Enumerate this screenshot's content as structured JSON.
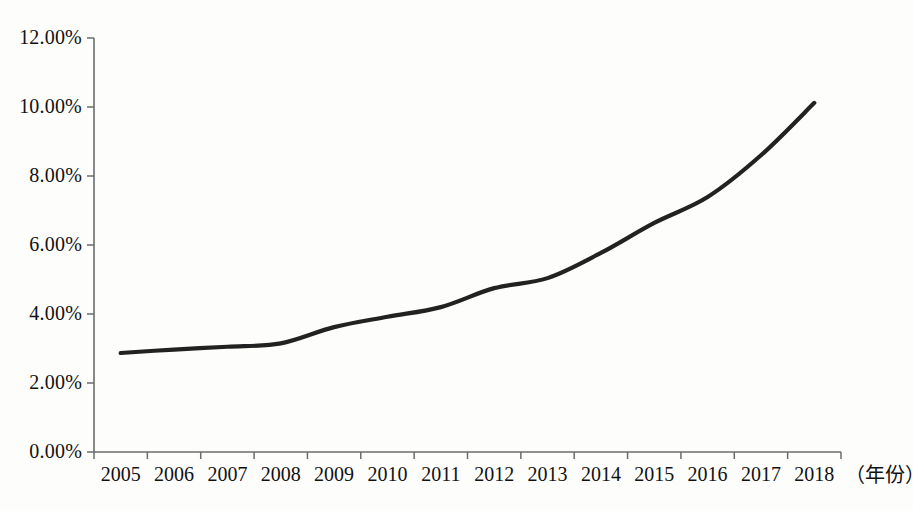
{
  "chart_data": {
    "type": "line",
    "title": "",
    "subtitle": "",
    "xlabel": "（年份）",
    "ylabel": "",
    "categories": [
      "2005",
      "2006",
      "2007",
      "2008",
      "2009",
      "2010",
      "2011",
      "2012",
      "2013",
      "2014",
      "2015",
      "2016",
      "2017",
      "2018"
    ],
    "x": [
      2005,
      2006,
      2007,
      2008,
      2009,
      2010,
      2011,
      2012,
      2013,
      2014,
      2015,
      2016,
      2017,
      2018
    ],
    "values": [
      2.87,
      2.97,
      3.05,
      3.15,
      3.62,
      3.92,
      4.2,
      4.75,
      5.04,
      5.77,
      6.64,
      7.39,
      8.6,
      10.12
    ],
    "series": [
      {
        "name": "",
        "values": [
          2.87,
          2.97,
          3.05,
          3.15,
          3.62,
          3.92,
          4.2,
          4.75,
          5.04,
          5.77,
          6.64,
          7.39,
          8.6,
          10.12
        ],
        "color": "#222222"
      }
    ],
    "ylim": [
      0,
      12
    ],
    "yticks": [
      0,
      2,
      4,
      6,
      8,
      10,
      12
    ],
    "ytick_labels": [
      "0.00%",
      "2.00%",
      "4.00%",
      "6.00%",
      "8.00%",
      "10.00%",
      "12.00%"
    ],
    "grid": false,
    "legend": "none",
    "line_color": "#222222",
    "axis_color": "#6b6b6b",
    "markers": false
  },
  "axes": {
    "y_axis_name": "percentage-axis",
    "x_axis_name": "year-axis"
  }
}
